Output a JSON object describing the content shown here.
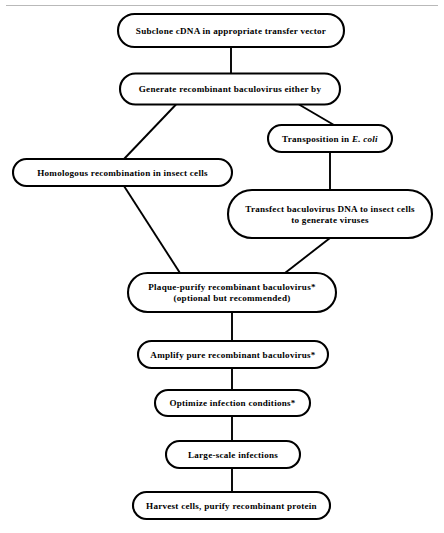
{
  "figure": {
    "background_color": "#ffffff",
    "line_color": "#000000",
    "rule_color": "#b9b9b9"
  },
  "nodes": [
    {
      "id": "subclone",
      "lines": [
        "Subclone cDNA in appropriate transfer vector"
      ],
      "cx": 231,
      "cy": 30.5,
      "w": 226,
      "h": 33
    },
    {
      "id": "generate",
      "lines": [
        "Generate recombinant baculovirus either by"
      ],
      "cx": 230,
      "cy": 89,
      "w": 220,
      "h": 31
    },
    {
      "id": "transposition",
      "lines": [
        "Transposition in ",
        "E. coli"
      ],
      "italic_tail": "E. coli",
      "cx": 330,
      "cy": 138.5,
      "w": 124,
      "h": 27
    },
    {
      "id": "homologous",
      "lines": [
        "Homologous  recombination in insect cells"
      ],
      "cx": 122.5,
      "cy": 172.5,
      "w": 219,
      "h": 27
    },
    {
      "id": "transfect",
      "lines": [
        "Transfect baculovirus DNA  to insect cells",
        "to generate viruses"
      ],
      "cx": 330,
      "cy": 214,
      "w": 204,
      "h": 48
    },
    {
      "id": "plaque",
      "lines": [
        "Plaque-purify recombinant baculovirus*",
        "(optional but  recommended)"
      ],
      "cx": 232,
      "cy": 292.5,
      "w": 208,
      "h": 39
    },
    {
      "id": "amplify",
      "lines": [
        "Amplify pure  recombinant  baculovirus*"
      ],
      "cx": 233,
      "cy": 354.5,
      "w": 190,
      "h": 27
    },
    {
      "id": "optimize",
      "lines": [
        "Optimize  infection conditions*"
      ],
      "cx": 232.5,
      "cy": 403,
      "w": 155,
      "h": 26
    },
    {
      "id": "largescale",
      "lines": [
        "Large-scale  infections"
      ],
      "cx": 233,
      "cy": 454.5,
      "w": 134,
      "h": 27
    },
    {
      "id": "harvest",
      "lines": [
        "Harvest cells, purify recombinant protein"
      ],
      "cx": 231.5,
      "cy": 505.5,
      "w": 197,
      "h": 27
    }
  ],
  "connectors": [
    {
      "id": "subclone-to-generate",
      "from": "subclone",
      "to": "generate",
      "points": "231,47 231,73.5"
    },
    {
      "id": "generate-to-homologous",
      "from": "generate",
      "to": "homologous",
      "points": "176,104.5 124,159"
    },
    {
      "id": "generate-to-transposition",
      "from": "generate",
      "to": "transposition",
      "points": "299,104.5 334,125"
    },
    {
      "id": "transposition-to-transfect",
      "from": "transposition",
      "to": "transfect",
      "points": "330,152 330,190"
    },
    {
      "id": "homologous-to-plaque",
      "from": "homologous",
      "to": "plaque",
      "points": "124,186 180,273"
    },
    {
      "id": "transfect-to-plaque",
      "from": "transfect",
      "to": "plaque",
      "points": "330,238 285,273"
    },
    {
      "id": "plaque-to-amplify",
      "from": "plaque",
      "to": "amplify",
      "points": "232,312 232,341"
    },
    {
      "id": "amplify-to-optimize",
      "from": "amplify",
      "to": "optimize",
      "points": "232,368 232,390"
    },
    {
      "id": "optimize-to-largescale",
      "from": "optimize",
      "to": "largescale",
      "points": "232,416 232,441"
    },
    {
      "id": "largescale-to-harvest",
      "from": "largescale",
      "to": "harvest",
      "points": "232,468 232,492"
    }
  ],
  "top_rule": {
    "x1": 6,
    "y1": 5.5,
    "x2": 438,
    "y2": 5.5
  }
}
